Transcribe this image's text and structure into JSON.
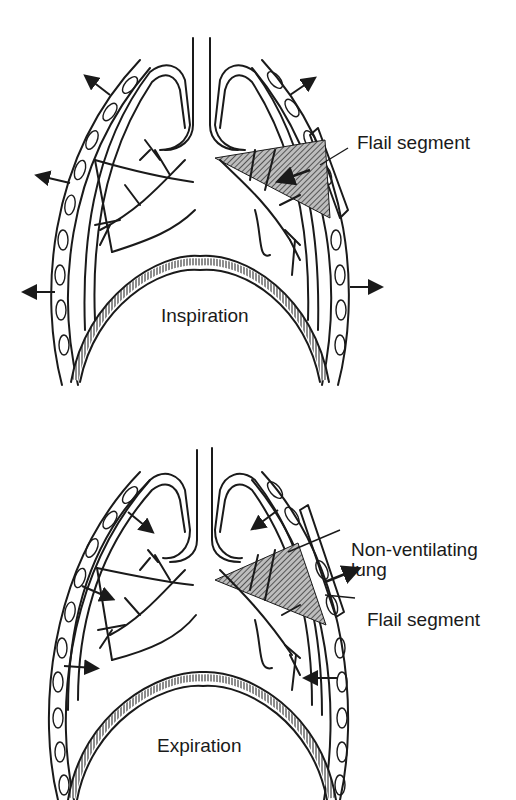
{
  "figure": {
    "panels": [
      {
        "id": "inspiration",
        "phase_label": "Inspiration",
        "annotations": [
          {
            "text": "Flail segment",
            "target": "flail segment"
          }
        ],
        "arrows": "chest wall arrows point outward; flail segment arrow points inward"
      },
      {
        "id": "expiration",
        "phase_label": "Expiration",
        "annotations": [
          {
            "text": "Non-ventilating lung",
            "line1": "Non-ventilating",
            "line2": "lung",
            "target": "hatched lung region"
          },
          {
            "text": "Flail segment",
            "target": "flail segment"
          }
        ],
        "arrows": "chest wall arrows point inward; flail segment arrow points outward"
      }
    ],
    "colors": {
      "ink": "#1a1a1a",
      "background": "#ffffff",
      "hatch": "#555555"
    }
  }
}
